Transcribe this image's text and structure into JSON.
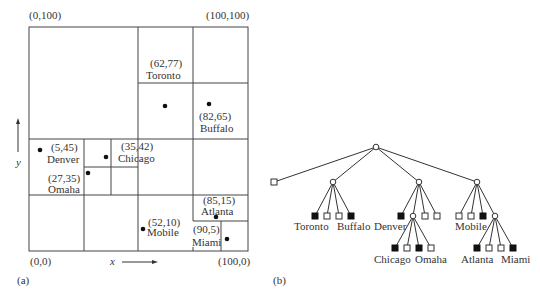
{
  "panel_a": {
    "caption": "(a)",
    "corners": {
      "top_left": "(0,100)",
      "top_right": "(100,100)",
      "bottom_left": "(0,0)",
      "bottom_right": "(100,0)"
    },
    "x_axis_label": "x",
    "y_axis_label": "y",
    "cities": [
      {
        "name": "Toronto",
        "coords": "(62,77)",
        "x": 62,
        "y": 77
      },
      {
        "name": "Buffalo",
        "coords": "(82,65)",
        "x": 82,
        "y": 65
      },
      {
        "name": "Denver",
        "coords": "(5,45)",
        "x": 5,
        "y": 45
      },
      {
        "name": "Chicago",
        "coords": "(35,42)",
        "x": 35,
        "y": 42
      },
      {
        "name": "Omaha",
        "coords": "(27,35)",
        "x": 27,
        "y": 35
      },
      {
        "name": "Mobile",
        "coords": "(52,10)",
        "x": 52,
        "y": 10
      },
      {
        "name": "Atlanta",
        "coords": "(85,15)",
        "x": 85,
        "y": 15
      },
      {
        "name": "Miami",
        "coords": "(90,5)",
        "x": 90,
        "y": 5
      }
    ]
  },
  "panel_b": {
    "caption": "(b)",
    "leaf_labels": [
      "Toronto",
      "Buffalo",
      "Denver",
      "Chicago",
      "Omaha",
      "Mobile",
      "Atlanta",
      "Miami"
    ]
  }
}
